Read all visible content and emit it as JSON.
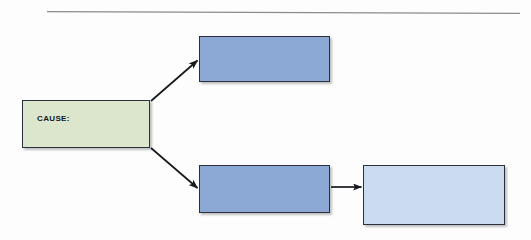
{
  "diagram": {
    "background_color": "#fdfdfd",
    "rule": {
      "name": "page-top-rule",
      "color": "#8c8c8c"
    },
    "nodes": [
      {
        "id": "cause",
        "label": "CAUSE:",
        "fill": "#dce6cc",
        "border": "#2c3038",
        "text_color": "#13161b",
        "x": 22,
        "y": 100,
        "width": 128,
        "height": 48
      },
      {
        "id": "effect-upper",
        "label": "",
        "fill": "#8ca8d4",
        "border": "#2c3038",
        "text_color": "#13161b",
        "x": 199,
        "y": 36,
        "width": 131,
        "height": 46
      },
      {
        "id": "effect-lower",
        "label": "",
        "fill": "#8ca8d4",
        "border": "#2c3038",
        "text_color": "#13161b",
        "x": 199,
        "y": 165,
        "width": 131,
        "height": 48
      },
      {
        "id": "outcome",
        "label": "",
        "fill": "#cbdcf0",
        "border": "#2c3038",
        "text_color": "#13161b",
        "x": 363,
        "y": 165,
        "width": 142,
        "height": 60
      }
    ],
    "connectors": [
      {
        "id": "cause-to-effect-upper",
        "from": "cause",
        "to": "effect-upper",
        "direction": "up-right",
        "color": "#16191e"
      },
      {
        "id": "cause-to-effect-lower",
        "from": "cause",
        "to": "effect-lower",
        "direction": "down-right",
        "color": "#16191e"
      },
      {
        "id": "effect-lower-to-outcome",
        "from": "effect-lower",
        "to": "outcome",
        "direction": "right",
        "color": "#16191e"
      }
    ]
  }
}
